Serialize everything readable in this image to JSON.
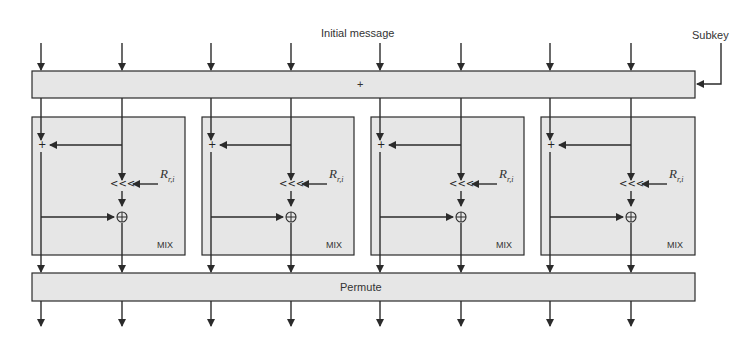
{
  "diagram": {
    "input_label": "Initial message",
    "key_label": "Subkey",
    "top_bar": {
      "label": "+",
      "operation": "add-subkey"
    },
    "bottom_bar": {
      "label": "Permute"
    },
    "mix_blocks": [
      {
        "label": "MIX",
        "add_symbol": "+",
        "rotate_symbol": "<<<",
        "xor_symbol": "⊕",
        "rotation_label": "R",
        "rotation_sub": "r,i"
      },
      {
        "label": "MIX",
        "add_symbol": "+",
        "rotate_symbol": "<<<",
        "xor_symbol": "⊕",
        "rotation_label": "R",
        "rotation_sub": "r,i"
      },
      {
        "label": "MIX",
        "add_symbol": "+",
        "rotate_symbol": "<<<",
        "xor_symbol": "⊕",
        "rotation_label": "R",
        "rotation_sub": "r,i"
      },
      {
        "label": "MIX",
        "add_symbol": "+",
        "rotate_symbol": "<<<",
        "xor_symbol": "⊕",
        "rotation_label": "R",
        "rotation_sub": "r,i"
      }
    ],
    "word_count": 8,
    "colors": {
      "box_fill": "#e6e6e6",
      "stroke": "#2b2b2b",
      "background": "#ffffff"
    }
  }
}
